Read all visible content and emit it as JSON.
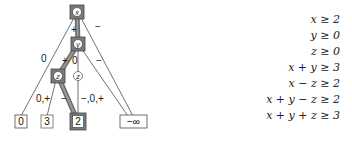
{
  "tree": {
    "nodes": [
      {
        "id": "x",
        "label": "x",
        "highlighted": true
      },
      {
        "id": "y",
        "label": "y",
        "highlighted": true
      },
      {
        "id": "z-left",
        "label": "z",
        "highlighted": true
      },
      {
        "id": "z-mid",
        "label": "z",
        "highlighted": false
      }
    ],
    "leaves": [
      {
        "id": "leaf-0",
        "label": "0",
        "highlighted": false
      },
      {
        "id": "leaf-3",
        "label": "3",
        "highlighted": false
      },
      {
        "id": "leaf-2",
        "label": "2",
        "highlighted": true
      },
      {
        "id": "leaf-neg-inf",
        "label": "−∞",
        "highlighted": false
      }
    ],
    "edge_labels": {
      "x_to_0": "0",
      "x_to_y": "+",
      "x_to_neginf": "−",
      "y_to_zleft": "+",
      "y_to_zmid": "0",
      "y_to_neginf": "−",
      "zleft_to_3": "0,+",
      "zleft_to_2": "−",
      "zmid_to_2": "−,0,+"
    },
    "highlight_color": "#555555"
  },
  "constraints": [
    "x ≥ 2",
    "y ≥ 0",
    "z ≥ 0",
    "x + y ≥ 3",
    "x − z ≥ 2",
    "x + y − z ≥ 2",
    "x + y + z ≥ 3"
  ]
}
